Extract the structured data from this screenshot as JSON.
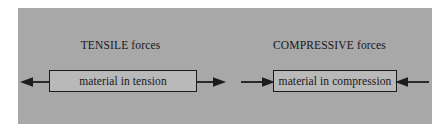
{
  "figure": {
    "panel_background": "#a8a8a8",
    "box_fill": "#b9b9b9",
    "stroke_color": "#1c1c1f",
    "page_background": "#ffffff"
  },
  "tension": {
    "label": "TENSILE forces",
    "box_text": "material in tension",
    "left_arrow_direction": "left",
    "right_arrow_direction": "right"
  },
  "compression": {
    "label": "COMPRESSIVE forces",
    "box_text": "material in compression",
    "left_arrow_direction": "right",
    "right_arrow_direction": "left"
  }
}
